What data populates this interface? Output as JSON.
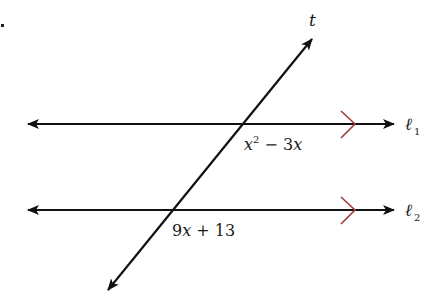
{
  "figure": {
    "marker": ".",
    "transversal_label": "t",
    "lines": [
      {
        "name": "ℓ",
        "subscript": "1",
        "angle_expression": {
          "base": "x",
          "exponent": "2",
          "rest": " − 3",
          "var": "x"
        }
      },
      {
        "name": "ℓ",
        "subscript": "2",
        "angle_expression": {
          "text_num": "9",
          "var": "x",
          "rest": " + 13"
        }
      }
    ],
    "colors": {
      "line": "#111111",
      "parallel_marker": "#a03c3c"
    }
  }
}
